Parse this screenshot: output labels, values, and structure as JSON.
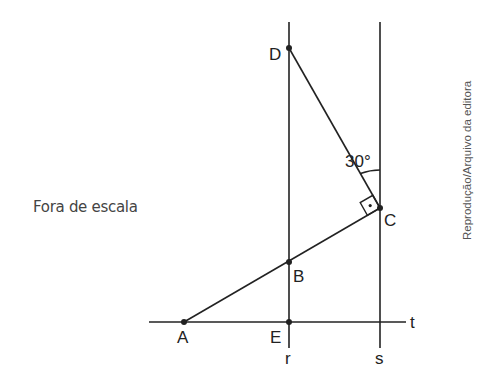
{
  "note": "Fora de escala",
  "credit": "Reprodução/Arquivo da editora",
  "angle_label": "30°",
  "lines": {
    "r": "r",
    "s": "s",
    "t": "t"
  },
  "points": {
    "A": "A",
    "B": "B",
    "C": "C",
    "D": "D",
    "E": "E"
  },
  "colors": {
    "stroke": "#222222",
    "background": "#ffffff"
  }
}
